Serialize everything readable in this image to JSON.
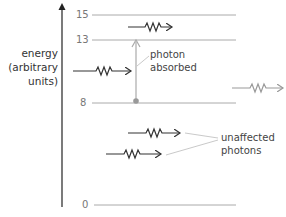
{
  "axis": {
    "title_line1": "energy",
    "title_line2": "(arbitrary",
    "title_line3": "units)"
  },
  "levels": [
    {
      "value": "15",
      "y": 15
    },
    {
      "value": "13",
      "y": 40
    },
    {
      "value": "8",
      "y": 103
    },
    {
      "value": "0",
      "y": 205
    }
  ],
  "labels": {
    "absorbed_line1": "photon",
    "absorbed_line2": "absorbed",
    "unaffected_line1": "unaffected",
    "unaffected_line2": "photons"
  },
  "colors": {
    "dark": "#333333",
    "gray": "#999999",
    "level_line": "#aaaaaa"
  },
  "photons": [
    {
      "id": "top-photon",
      "x1": 128,
      "x2": 174,
      "y": 27,
      "color": "dark"
    },
    {
      "id": "incoming-photon",
      "x1": 73,
      "x2": 133,
      "y": 71,
      "color": "dark"
    },
    {
      "id": "emitted-photon",
      "x1": 232,
      "x2": 285,
      "y": 88,
      "color": "gray"
    },
    {
      "id": "unaffected-photon-1",
      "x1": 128,
      "x2": 182,
      "y": 133,
      "color": "dark"
    },
    {
      "id": "unaffected-photon-2",
      "x1": 106,
      "x2": 163,
      "y": 154,
      "color": "dark"
    }
  ]
}
